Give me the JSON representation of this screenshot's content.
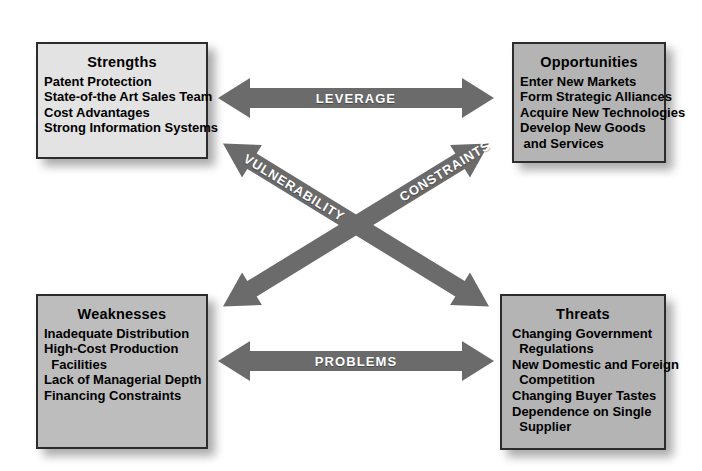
{
  "diagram": {
    "type": "swot-matrix",
    "colors": {
      "arrow_gray": "#6b6b6b",
      "box_light": "#e3e3e3",
      "box_medium": "#b4b4b4",
      "box_border": "#2c2c2c",
      "text": "#000000",
      "label_text": "#ffffff",
      "background": "#ffffff"
    }
  },
  "quadrants": {
    "strengths": {
      "title": "Strengths",
      "items": [
        "Patent Protection",
        "State-of-the Art Sales Team",
        "Cost Advantages",
        "Strong Information Systems"
      ]
    },
    "opportunities": {
      "title": "Opportunities",
      "items": [
        "Enter New Markets",
        "Form Strategic Alliances",
        "Acquire New Technologies",
        "Develop New Goods",
        " and Services"
      ]
    },
    "weaknesses": {
      "title": "Weaknesses",
      "items": [
        "Inadequate Distribution",
        "High-Cost Production",
        "  Facilities",
        "Lack of Managerial Depth",
        "Financing Constraints"
      ]
    },
    "threats": {
      "title": "Threats",
      "items": [
        "Changing Government",
        "  Regulations",
        "New Domestic and Foreign",
        "  Competition",
        "Changing Buyer Tastes",
        "Dependence on Single",
        "  Supplier"
      ]
    }
  },
  "connectors": {
    "leverage": {
      "label": "LEVERAGE",
      "from": "strengths",
      "to": "opportunities",
      "orientation": "horizontal"
    },
    "problems": {
      "label": "PROBLEMS",
      "from": "weaknesses",
      "to": "threats",
      "orientation": "horizontal"
    },
    "vulnerability": {
      "label": "VULNERABILITY",
      "from": "strengths",
      "to": "threats",
      "orientation": "diagonal-down"
    },
    "constraints": {
      "label": "CONSTRAINTS",
      "from": "weaknesses",
      "to": "opportunities",
      "orientation": "diagonal-up"
    }
  }
}
